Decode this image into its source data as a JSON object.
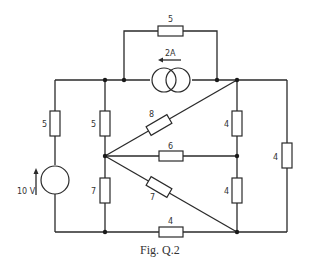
{
  "figure": {
    "caption": "Fig. Q.2",
    "components": {
      "r_top_bridge": "5",
      "current_source": "2A",
      "r_left": "5",
      "r_inner_upper": "5",
      "r_inner_lower": "7",
      "r_diag_upper": "8",
      "r_middle": "6",
      "r_diag_lower": "7",
      "r_right_upper": "4",
      "r_right_lower": "4",
      "r_far_right": "4",
      "r_bottom": "4",
      "voltage_source": "10 V"
    }
  }
}
